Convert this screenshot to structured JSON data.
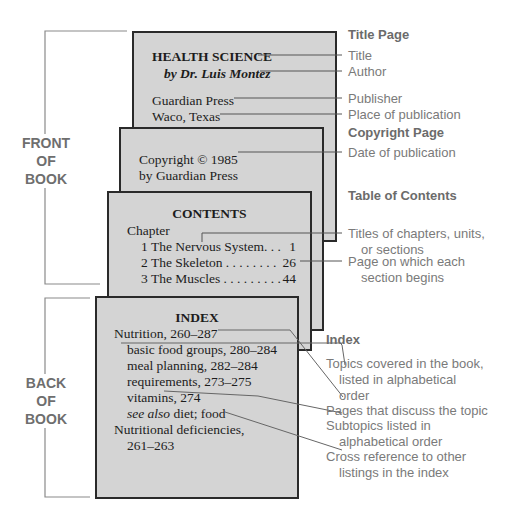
{
  "brackets": {
    "front": [
      "FRONT",
      "OF",
      "BOOK"
    ],
    "back": [
      "BACK",
      "OF",
      "BOOK"
    ]
  },
  "title_page": {
    "title": "HEALTH SCIENCE",
    "author": "by Dr. Luis Montez",
    "publisher": "Guardian Press",
    "place": "Waco, Texas"
  },
  "copyright_page": {
    "line1": "Copyright © 1985",
    "line2": "by Guardian Press"
  },
  "contents_page": {
    "heading": "CONTENTS",
    "chapter_label": "Chapter",
    "rows": [
      {
        "text": "1 The Nervous System. . .",
        "page": "1"
      },
      {
        "text": "2 The Skeleton . . . . . . . .",
        "page": "26"
      },
      {
        "text": "3 The Muscles . . . . . . . . .",
        "page": "44"
      }
    ]
  },
  "index_page": {
    "heading": "INDEX",
    "lines": [
      "Nutrition, 260–287",
      "basic food groups, 280–284",
      "meal planning, 282–284",
      "requirements, 273–275",
      "vitamins, 274",
      "diet; food",
      "Nutritional deficiencies,",
      "261–263"
    ],
    "see_also": "see also"
  },
  "labels": {
    "title_page_heading": "Title Page",
    "title": "Title",
    "author": "Author",
    "publisher": "Publisher",
    "place": "Place of publication",
    "copyright_heading": "Copyright Page",
    "date": "Date of publication",
    "toc_heading": "Table of Contents",
    "titles_1": "Titles of chapters, units,",
    "titles_2": "or sections",
    "page_1": "Page on which each",
    "page_2": "section  begins",
    "index_heading": "Index",
    "topics_1": "Topics covered in the book,",
    "topics_2": "listed in alphabetical",
    "topics_3": "order",
    "pages": "Pages that discuss the topic",
    "sub_1": "Subtopics listed in",
    "sub_2": "alphabetical order",
    "cross_1": "Cross reference to other",
    "cross_2": "listings in the index"
  },
  "colors": {
    "page_fill": "#d4d4d4",
    "page_border": "#2a2a2a",
    "label_text": "#7a7a7a",
    "leader_line": "#555555"
  }
}
